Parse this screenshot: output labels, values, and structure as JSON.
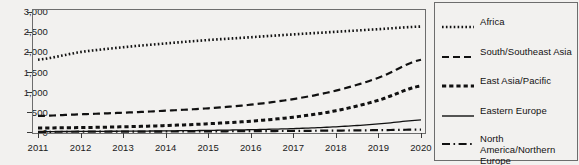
{
  "chart_data": {
    "type": "line",
    "title": "",
    "subtitle": "",
    "xlabel": "",
    "ylabel": "",
    "x": [
      2011,
      2012,
      2013,
      2014,
      2015,
      2016,
      2017,
      2018,
      2019,
      2020
    ],
    "xtick_labels": [
      "2011",
      "2012",
      "2013",
      "2014",
      "2015",
      "2016",
      "2017",
      "2018",
      "2019",
      "2020"
    ],
    "ytick_labels": [
      "0",
      "500",
      "1,000",
      "1,500",
      "2,000",
      "2,500",
      "3,000"
    ],
    "ytick_values": [
      0,
      500,
      1000,
      1500,
      2000,
      2500,
      3000
    ],
    "ylim": [
      0,
      3000
    ],
    "xlim": [
      2011,
      2020
    ],
    "grid": false,
    "legend_position": "right",
    "line_color": "#111111",
    "series": [
      {
        "name": "Africa",
        "dash": "dotted",
        "values": [
          1800,
          1990,
          2110,
          2205,
          2290,
          2360,
          2430,
          2495,
          2560,
          2625
        ]
      },
      {
        "name": "South/Southeast Asia",
        "dash": "long-dash",
        "values": [
          400,
          440,
          480,
          530,
          590,
          680,
          820,
          1030,
          1350,
          1800
        ]
      },
      {
        "name": "East Asia/Pacific",
        "dash": "square-dash",
        "values": [
          100,
          110,
          130,
          160,
          205,
          270,
          370,
          530,
          790,
          1150
        ]
      },
      {
        "name": "Eastern Europe",
        "dash": "solid",
        "values": [
          10,
          14,
          20,
          28,
          40,
          58,
          85,
          130,
          200,
          300
        ]
      },
      {
        "name": "North America/Northern Europe",
        "dash": "dash-dot",
        "values": [
          5,
          7,
          9,
          12,
          16,
          21,
          27,
          35,
          46,
          60
        ]
      }
    ]
  },
  "legend": {
    "items": [
      {
        "label": "Africa",
        "swatch": "dotted-line-swatch"
      },
      {
        "label": "South/Southeast Asia",
        "swatch": "long-dash-line-swatch"
      },
      {
        "label": "East Asia/Pacific",
        "swatch": "square-dash-line-swatch"
      },
      {
        "label": "Eastern Europe",
        "swatch": "solid-line-swatch"
      },
      {
        "label": "North America/Northern Europe",
        "swatch": "dash-dot-line-swatch"
      }
    ]
  }
}
